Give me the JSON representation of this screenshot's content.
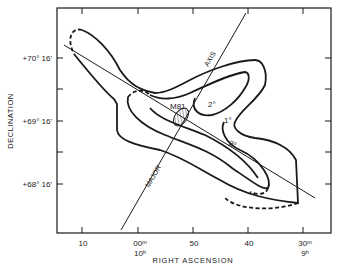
{
  "figure": {
    "object_label": "M81",
    "axis_line_upper_label": "AXIS",
    "axis_line_lower_label": "MAJOR",
    "contour_labels": [
      "2°",
      "1°",
      "2°"
    ],
    "x_axis": {
      "title": "RIGHT ASCENSION",
      "ticks": [
        {
          "label": "10",
          "sub": ""
        },
        {
          "label": "00ᵐ",
          "sub": "10ʰ"
        },
        {
          "label": "50",
          "sub": ""
        },
        {
          "label": "40",
          "sub": ""
        },
        {
          "label": "30ᵐ",
          "sub": "9ʰ"
        }
      ]
    },
    "y_axis": {
      "title": "DECLINATION",
      "ticks": [
        "+70° 16'",
        "+69° 16'",
        "+68° 16'"
      ]
    },
    "colors": {
      "ink": "#1a1a1a",
      "background": "#ffffff"
    }
  }
}
